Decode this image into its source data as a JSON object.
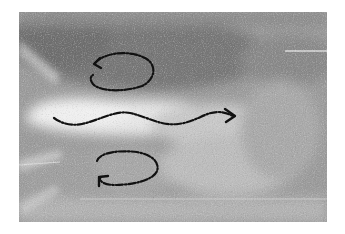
{
  "figure": {
    "kind": "grayscale flow-visualization photograph with annotated flow arrows",
    "background": "#ffffff",
    "photo": {
      "x": 19,
      "y": 12,
      "width": 308,
      "height": 210,
      "base_tone": "#9a9a9a",
      "dark_tone": "#6e6e6e",
      "light_tone": "#e8e8e8"
    },
    "annotations": {
      "stroke_color": "#111111",
      "stroke_style": "dash-dot",
      "upper_eddy": {
        "label": "upper-recirculation-eddy",
        "direction": "counter-clockwise",
        "center": [
          123,
          72
        ],
        "rx": 31,
        "ry": 18
      },
      "main_jet": {
        "label": "main-wavy-jet-arrow",
        "direction": "left-to-right",
        "start": [
          54,
          118
        ],
        "end": [
          235,
          116
        ]
      },
      "lower_eddy": {
        "label": "lower-recirculation-eddy",
        "direction": "clockwise",
        "center": [
          128,
          168
        ],
        "rx": 31,
        "ry": 17
      }
    }
  }
}
